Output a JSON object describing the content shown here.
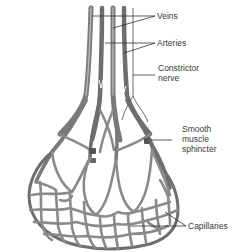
{
  "diagram": {
    "labels": {
      "veins": "Veins",
      "arteries": "Arteries",
      "constrictor_nerve": "Constrictor\nnerve",
      "smooth_muscle_sphincter": "Smooth\nmuscle\nsphincter",
      "capillaries": "Capillaries"
    },
    "colors": {
      "background": "#ffffff",
      "vessel_dark": "#6f6f6f",
      "vessel_light": "#a8a8a8",
      "capillary": "#8a8a8a",
      "label_text": "#3a3a3a",
      "leader_line": "#333333"
    }
  }
}
